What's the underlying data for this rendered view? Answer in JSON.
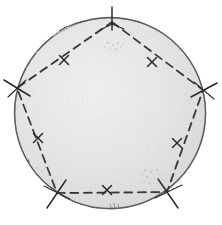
{
  "figure": {
    "background_color": "#ffffff",
    "disc": {
      "name": "shaded-circle",
      "center_x": 110,
      "center_y": 113,
      "radius": 96,
      "fill_color": "#e9e9e9",
      "fill_color_light": "#f4f4f4",
      "stroke_color": "#4a4a4a",
      "stroke_width": 1.4
    },
    "pentagon": {
      "name": "inscribed-pentagon",
      "stroke_color": "#333333",
      "stroke_width": 1.7,
      "dash_pattern": "7 5",
      "fill": "none",
      "vertices": [
        {
          "label": "A",
          "position": "top",
          "x": 112,
          "y": 22
        },
        {
          "label": "B",
          "position": "right",
          "x": 203,
          "y": 90
        },
        {
          "label": "C",
          "position": "bottom-right",
          "x": 167,
          "y": 192
        },
        {
          "label": "D",
          "position": "bottom-left",
          "x": 57,
          "y": 193
        },
        {
          "label": "E",
          "position": "left",
          "x": 17,
          "y": 88
        }
      ],
      "edges": [
        {
          "from": "A",
          "to": "B",
          "midpoint_x": 152,
          "midpoint_y": 62,
          "hash_marks": 1
        },
        {
          "from": "B",
          "to": "C",
          "midpoint_x": 177,
          "midpoint_y": 143,
          "hash_marks": 1
        },
        {
          "from": "C",
          "to": "D",
          "midpoint_x": 107,
          "midpoint_y": 190,
          "hash_marks": 1
        },
        {
          "from": "D",
          "to": "E",
          "midpoint_x": 38,
          "midpoint_y": 138,
          "hash_marks": 1
        },
        {
          "from": "E",
          "to": "A",
          "midpoint_x": 64,
          "midpoint_y": 60,
          "hash_marks": 1
        }
      ]
    },
    "vertex_ticks": {
      "name": "vertex-tick-marks",
      "stroke_color": "#2b2b2b",
      "stroke_width": 1.5,
      "length": 18,
      "count": 5,
      "note": "Short radial strokes crossing the circle at each pentagon vertex"
    },
    "side_hash_marks": {
      "name": "congruent-side-marks",
      "glyph": "x",
      "stroke_color": "#2b2b2b",
      "stroke_width": 1.5,
      "size": 9,
      "count": 5,
      "note": "Single x-shaped tick at the midpoint of each pentagon side"
    },
    "speckles": [
      {
        "x": 112,
        "y": 46,
        "count": 9
      },
      {
        "x": 150,
        "y": 176,
        "count": 11
      },
      {
        "x": 40,
        "y": 170,
        "count": 4
      },
      {
        "x": 113,
        "y": 207,
        "count": 3
      }
    ]
  }
}
